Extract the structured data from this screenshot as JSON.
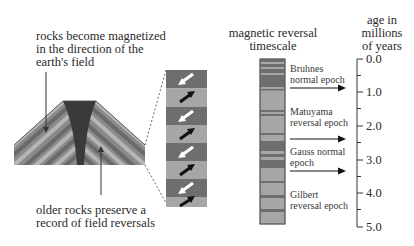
{
  "left_panel": {
    "top_label": [
      "rocks become magnetized",
      "in the direction of the",
      "earth's field"
    ],
    "bottom_label": [
      "older rocks preserve a",
      "record of field reversals"
    ]
  },
  "core_sample": {
    "bands": [
      "reversed",
      "normal",
      "reversed",
      "normal",
      "reversed",
      "normal",
      "reversed",
      "normal"
    ],
    "colors": {
      "normal": "#a6a6a6",
      "reversed": "#6e6e6e"
    }
  },
  "timescale": {
    "title": [
      "magnetic reversal",
      "timescale"
    ],
    "epochs": [
      {
        "name": [
          "Bruhnes",
          "normal epoch"
        ]
      },
      {
        "name": [
          "Matuyama",
          "reversal epoch"
        ]
      },
      {
        "name": [
          "Gauss normal",
          "epoch"
        ]
      },
      {
        "name": [
          "Gilbert",
          "reversal epoch"
        ]
      }
    ]
  },
  "age_axis": {
    "title": [
      "age in",
      "millions",
      "of years"
    ],
    "ticks": [
      "0.0",
      "1.0",
      "2.0",
      "3.0",
      "4.0",
      "5.0"
    ]
  },
  "colors": {
    "dark": "#6e6e6e",
    "light": "#a6a6a6",
    "magma": "#3a3a3a",
    "text": "#2a2a2a"
  }
}
